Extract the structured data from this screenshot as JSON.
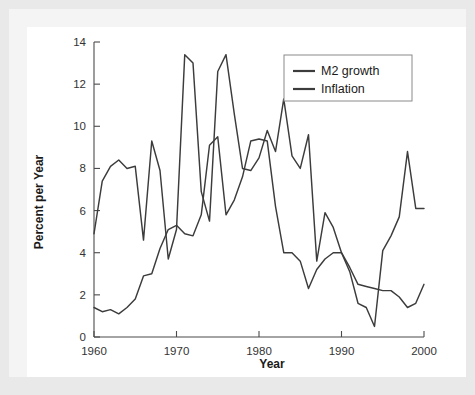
{
  "chart_data": {
    "type": "line",
    "title": "",
    "xlabel": "Year",
    "ylabel": "Percent per Year",
    "xlim": [
      1960,
      2000
    ],
    "ylim": [
      0,
      14
    ],
    "xticks": [
      1960,
      1970,
      1980,
      1990,
      2000
    ],
    "xtick_labels": [
      "1960",
      "1970",
      "1980",
      "1990",
      "2000"
    ],
    "yticks": [
      0,
      2,
      4,
      6,
      8,
      10,
      12,
      14
    ],
    "ytick_labels": [
      "0",
      "2",
      "4",
      "6",
      "8",
      "10",
      "12",
      "14"
    ],
    "grid": false,
    "legend_position": "top-right",
    "x": [
      1960,
      1961,
      1962,
      1963,
      1964,
      1965,
      1966,
      1967,
      1968,
      1969,
      1970,
      1971,
      1972,
      1973,
      1974,
      1975,
      1976,
      1977,
      1978,
      1979,
      1980,
      1981,
      1982,
      1983,
      1984,
      1985,
      1986,
      1987,
      1988,
      1989,
      1990,
      1991,
      1992,
      1993,
      1994,
      1995,
      1996,
      1997,
      1998,
      1999,
      2000
    ],
    "series": [
      {
        "name": "M2 growth",
        "color": "#3c3c3c",
        "values": [
          4.9,
          7.4,
          8.1,
          8.4,
          8.0,
          8.1,
          4.6,
          9.3,
          7.9,
          3.7,
          5.1,
          13.4,
          13.0,
          6.9,
          5.5,
          12.6,
          13.4,
          10.6,
          8.0,
          7.9,
          8.5,
          9.8,
          8.8,
          11.3,
          8.6,
          8.0,
          9.6,
          3.6,
          5.9,
          5.2,
          4.0,
          3.1,
          1.6,
          1.4,
          0.5,
          4.1,
          4.8,
          5.7,
          8.8,
          6.1,
          6.1
        ]
      },
      {
        "name": "Inflation",
        "color": "#3c3c3c",
        "values": [
          1.4,
          1.2,
          1.3,
          1.1,
          1.4,
          1.8,
          2.9,
          3.0,
          4.2,
          5.1,
          5.3,
          4.9,
          4.8,
          5.8,
          9.1,
          9.5,
          5.8,
          6.5,
          7.6,
          9.3,
          9.4,
          9.3,
          6.2,
          4.0,
          4.0,
          3.6,
          2.3,
          3.2,
          3.7,
          4.0,
          4.0,
          3.3,
          2.5,
          2.4,
          2.3,
          2.2,
          2.2,
          1.9,
          1.4,
          1.6,
          2.5
        ]
      }
    ]
  },
  "axes": {
    "ylabel": "Percent per Year",
    "xlabel": "Year"
  },
  "legend": {
    "items": [
      {
        "label": "M2 growth"
      },
      {
        "label": "Inflation"
      }
    ]
  }
}
